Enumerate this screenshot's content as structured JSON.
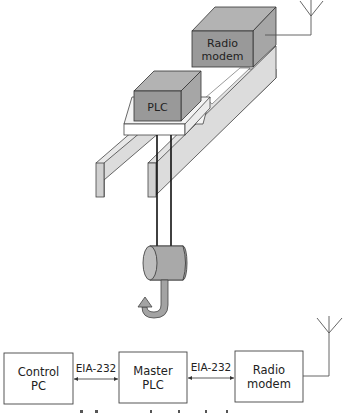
{
  "crane_illustration": {
    "radio_modem_label_line1": "Radio",
    "radio_modem_label_line2": "modem",
    "plc_label": "PLC"
  },
  "block_diagram": {
    "boxes": [
      {
        "id": "control-pc",
        "line1": "Control",
        "line2": "PC"
      },
      {
        "id": "master-plc",
        "line1": "Master",
        "line2": "PLC"
      },
      {
        "id": "radio-modem",
        "line1": "Radio",
        "line2": "modem"
      }
    ],
    "links": [
      {
        "from": "control-pc",
        "to": "master-plc",
        "label": "EIA-232"
      },
      {
        "from": "master-plc",
        "to": "radio-modem",
        "label": "EIA-232"
      }
    ]
  },
  "colors": {
    "box_face": "#9a9a9a",
    "box_top": "#b5b5b5",
    "box_side": "#a8a8a8",
    "rail_face": "#d9d9d9",
    "rail_light": "#efefef",
    "stroke": "#333333",
    "hook": "#a0a0a0"
  }
}
